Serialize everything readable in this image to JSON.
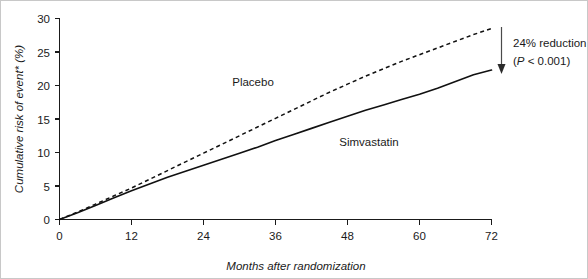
{
  "chart_data": {
    "type": "line",
    "title": "",
    "xlabel": "Months after randomization",
    "ylabel": "Cumulative risk of event* (%)",
    "xlim": [
      0,
      72
    ],
    "ylim": [
      0,
      30
    ],
    "grid": false,
    "legend_position": "inline-annotation",
    "xticks": [
      0,
      12,
      24,
      36,
      48,
      60,
      72
    ],
    "xtick_labels": [
      "0",
      "12",
      "24",
      "36",
      "48",
      "60",
      "72"
    ],
    "yticks": [
      0,
      5,
      10,
      15,
      20,
      25,
      30
    ],
    "ytick_labels": [
      "0",
      "5",
      "10",
      "15",
      "20",
      "25",
      "30"
    ],
    "x": [
      0,
      3,
      6,
      9,
      12,
      15,
      18,
      21,
      24,
      27,
      30,
      33,
      36,
      39,
      42,
      45,
      48,
      51,
      54,
      57,
      60,
      63,
      66,
      69,
      72
    ],
    "series": [
      {
        "name": "Placebo",
        "style": "dashed",
        "color": "#111111",
        "values": [
          0.0,
          1.1,
          2.3,
          3.5,
          4.7,
          6.0,
          7.3,
          8.6,
          9.9,
          11.2,
          12.5,
          13.8,
          15.1,
          16.4,
          17.7,
          19.0,
          20.2,
          21.4,
          22.5,
          23.6,
          24.6,
          25.6,
          26.6,
          27.6,
          28.5
        ]
      },
      {
        "name": "Simvastatin",
        "style": "solid",
        "color": "#111111",
        "values": [
          0.0,
          1.0,
          2.1,
          3.2,
          4.3,
          5.3,
          6.3,
          7.2,
          8.1,
          9.0,
          9.9,
          10.8,
          11.8,
          12.7,
          13.6,
          14.5,
          15.4,
          16.3,
          17.1,
          17.9,
          18.7,
          19.6,
          20.6,
          21.6,
          22.3
        ]
      }
    ],
    "annotations": [
      {
        "name": "reduction-annotation",
        "line1": "24% reduction",
        "line2_prefix": "(",
        "line2_italic": "P",
        "line2_suffix": " < 0.001)",
        "line2_full": "(P < 0.001)",
        "arrow": "down",
        "at_x": 72,
        "from_y": 28.5,
        "to_y": 22.3
      }
    ]
  },
  "labels": {
    "placebo": "Placebo",
    "simvastatin": "Simvastatin"
  }
}
